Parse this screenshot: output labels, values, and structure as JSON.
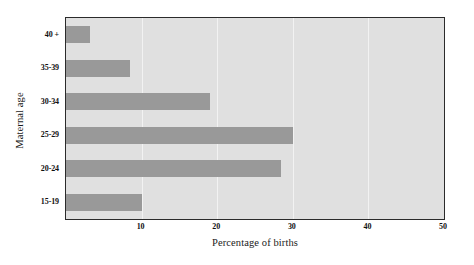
{
  "chart_data": {
    "type": "bar",
    "orientation": "horizontal",
    "title": "",
    "xlabel": "Percentage of births",
    "ylabel": "Maternal age",
    "categories": [
      "15-19",
      "20-24",
      "25-29",
      "30-34",
      "35-39",
      "40 +"
    ],
    "values": [
      10.0,
      28.5,
      30.0,
      19.0,
      8.5,
      3.2
    ],
    "xlim": [
      0,
      50
    ],
    "xticks": [
      10,
      20,
      30,
      40,
      50
    ],
    "xtick_labels": [
      "10",
      "20",
      "30",
      "40",
      "50"
    ],
    "grid": "vertical",
    "legend": "none",
    "bar_color": "#999999",
    "plot_background": "#e0e0e0",
    "gridline_color": "#f2f2f2",
    "axis_color": "#2b2b2b"
  },
  "axes": {
    "y_title": "Maternal age",
    "x_title": "Percentage of births"
  }
}
